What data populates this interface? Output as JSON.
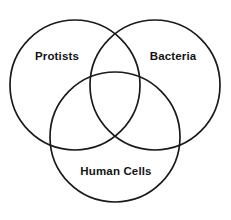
{
  "diagram": {
    "type": "venn-3-set",
    "canvas": {
      "width": 231,
      "height": 220,
      "background": "#ffffff"
    },
    "stroke": {
      "color": "#1a1a1a",
      "width": 1.7
    },
    "sets": [
      {
        "id": "protists",
        "label": "Protists",
        "position": "top-left",
        "circle": {
          "cx": 75,
          "cy": 85,
          "r": 65
        },
        "label_position": {
          "x": 57,
          "y": 57
        }
      },
      {
        "id": "bacteria",
        "label": "Bacteria",
        "position": "top-right",
        "circle": {
          "cx": 155,
          "cy": 85,
          "r": 65
        },
        "label_position": {
          "x": 173,
          "y": 57
        }
      },
      {
        "id": "human-cells",
        "label": "Human Cells",
        "position": "bottom-center",
        "circle": {
          "cx": 115,
          "cy": 137,
          "r": 65
        },
        "label_position": {
          "x": 116,
          "y": 172
        }
      }
    ]
  }
}
